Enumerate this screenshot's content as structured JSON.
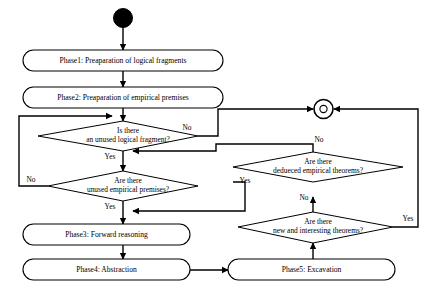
{
  "diagram": {
    "type": "flowchart",
    "title": "",
    "nodes": [
      {
        "id": "start",
        "kind": "start-node",
        "label": ""
      },
      {
        "id": "phase1",
        "kind": "process",
        "label": "Phase1: Preaparation of logical fragments"
      },
      {
        "id": "phase2",
        "kind": "process",
        "label": "Phase2: Preaparation of empirical premises"
      },
      {
        "id": "decision-logical-fragment",
        "kind": "decision",
        "line1": "Is there",
        "line2": "an unused logical fragment?"
      },
      {
        "id": "decision-empirical-premises",
        "kind": "decision",
        "line1": "Are there",
        "line2": "unused empirical premises?"
      },
      {
        "id": "phase3",
        "kind": "process",
        "label": "Phase3: Forward reasoning"
      },
      {
        "id": "phase4",
        "kind": "process",
        "label": "Phase4: Abstraction"
      },
      {
        "id": "phase5",
        "kind": "process",
        "label": "Phase5: Excavation"
      },
      {
        "id": "decision-deduced-theorems",
        "kind": "decision",
        "line1": "Are there",
        "line2": "dedueced empirical theorems?"
      },
      {
        "id": "decision-new-theorems",
        "kind": "decision",
        "line1": "Are there",
        "line2": "new and interesting theorems?"
      },
      {
        "id": "end",
        "kind": "end-node",
        "label": ""
      }
    ],
    "edge_labels": {
      "logical_fragment_no": "No",
      "logical_fragment_yes": "Yes",
      "empirical_premises_no": "No",
      "empirical_premises_yes": "Yes",
      "deduced_theorems_no": "No",
      "deduced_theorems_yes": "Yes",
      "new_theorems_no": "No",
      "new_theorems_yes": "Yes"
    },
    "colors": {
      "stroke": "#000000",
      "fill": "#ffffff",
      "background": "#ffffff"
    }
  }
}
